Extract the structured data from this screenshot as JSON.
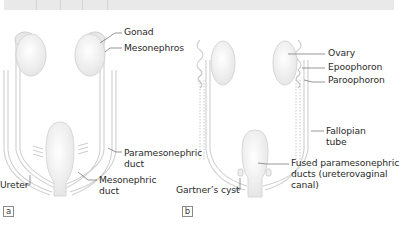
{
  "figure": {
    "panels": [
      {
        "tag": "a",
        "labels": {
          "gonad": "Gonad",
          "mesonephros": "Mesonephros",
          "paramesonephric_duct_l1": "Paramesonephric",
          "paramesonephric_duct_l2": "duct",
          "ureter": "Ureter",
          "mesonephric_duct_l1": "Mesonephric",
          "mesonephric_duct_l2": "duct"
        }
      },
      {
        "tag": "b",
        "labels": {
          "ovary": "Ovary",
          "epoophoron": "Epoophoron",
          "paroophoron": "Paroophoron",
          "fallopian_tube_l1": "Fallopian",
          "fallopian_tube_l2": "tube",
          "fused_l1": "Fused paramesonephric",
          "fused_l2": "ducts (ureterovaginal",
          "fused_l3": "canal)",
          "gartners_cyst": "Gartner’s cyst"
        }
      }
    ],
    "colors": {
      "organ_fill": "#f2f2f2",
      "organ_stroke": "#d0d0d0",
      "duct_stroke": "#cfcfcf",
      "leader_line": "#6a6a6a",
      "topbar": "#e9e9e9"
    }
  }
}
